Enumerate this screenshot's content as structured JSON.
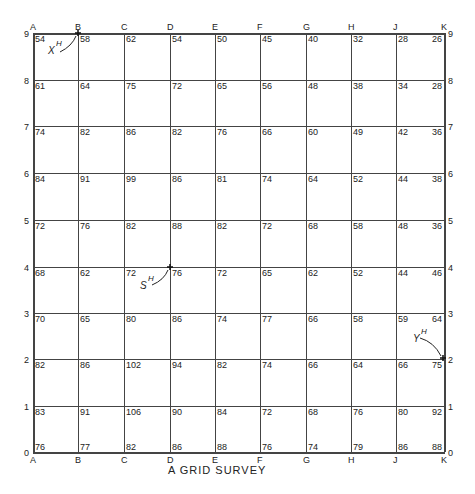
{
  "title": "A GRID SURVEY",
  "columns": [
    "A",
    "B",
    "C",
    "D",
    "E",
    "F",
    "G",
    "H",
    "J",
    "K"
  ],
  "rows": [
    "9",
    "8",
    "7",
    "6",
    "5",
    "4",
    "3",
    "2",
    "1",
    "0"
  ],
  "values": [
    [
      "54",
      "58",
      "62",
      "54",
      "50",
      "45",
      "40",
      "32",
      "28",
      "26"
    ],
    [
      "61",
      "64",
      "75",
      "72",
      "65",
      "56",
      "48",
      "38",
      "34",
      "28"
    ],
    [
      "74",
      "82",
      "86",
      "82",
      "76",
      "66",
      "60",
      "49",
      "42",
      "36"
    ],
    [
      "84",
      "91",
      "99",
      "86",
      "81",
      "74",
      "64",
      "52",
      "44",
      "38"
    ],
    [
      "72",
      "76",
      "82",
      "88",
      "82",
      "72",
      "68",
      "58",
      "48",
      "36"
    ],
    [
      "68",
      "62",
      "72",
      "76",
      "72",
      "65",
      "62",
      "52",
      "44",
      "46"
    ],
    [
      "70",
      "65",
      "80",
      "86",
      "74",
      "77",
      "66",
      "58",
      "59",
      "64"
    ],
    [
      "82",
      "86",
      "102",
      "94",
      "82",
      "74",
      "66",
      "64",
      "66",
      "75"
    ],
    [
      "83",
      "91",
      "106",
      "90",
      "84",
      "72",
      "68",
      "76",
      "80",
      "92"
    ],
    [
      "76",
      "77",
      "82",
      "86",
      "88",
      "76",
      "74",
      "79",
      "86",
      "88"
    ]
  ],
  "markers": [
    {
      "label": "X",
      "sup": "H",
      "at": "B9"
    },
    {
      "label": "S",
      "sup": "H",
      "at": "D4"
    },
    {
      "label": "Y",
      "sup": "H",
      "at": "K2"
    }
  ]
}
